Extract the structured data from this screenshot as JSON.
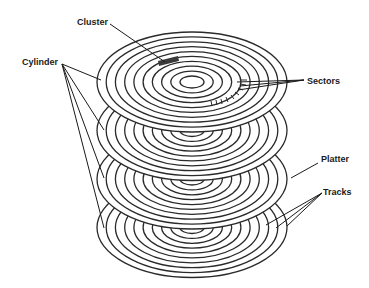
{
  "diagram": {
    "type": "hard disk platter stack",
    "colors": {
      "line": "#2a2a2a",
      "background": "#ffffff",
      "cluster": "#3a3a3a"
    },
    "platters": {
      "count": 4,
      "center_x": 192,
      "top_center_y": 82,
      "spacing_y": 48.5,
      "outer_rx": 95,
      "outer_ry": 50,
      "track_count": 9,
      "hole_rx": 12,
      "hole_ry": 6
    },
    "labels": {
      "cluster": "Cluster",
      "cylinder": "Cylinder",
      "sectors": "Sectors",
      "platter": "Platter",
      "tracks": "Tracks"
    }
  }
}
